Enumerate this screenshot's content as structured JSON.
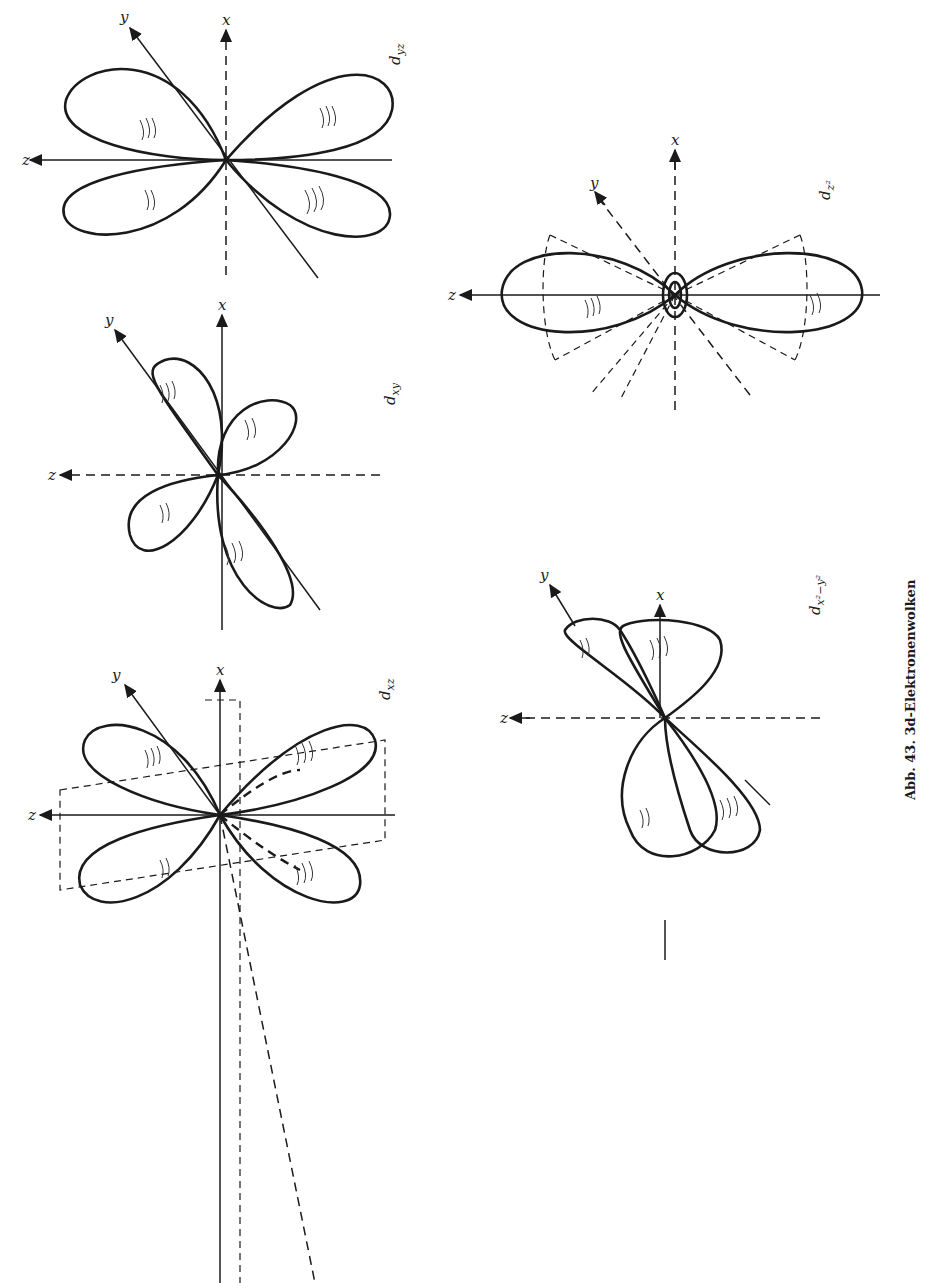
{
  "figure": {
    "caption": "Abb. 43. 3d-Elektronenwolken",
    "orientation": "rotated 90° counter-clockwise",
    "panels": [
      {
        "id": "dxz",
        "label": "d",
        "subscript": "xz",
        "axes": [
          "x",
          "y",
          "z"
        ]
      },
      {
        "id": "dxy",
        "label": "d",
        "subscript": "xy",
        "axes": [
          "x",
          "y",
          "z"
        ]
      },
      {
        "id": "dyz",
        "label": "d",
        "subscript": "yz",
        "axes": [
          "x",
          "y",
          "z"
        ]
      },
      {
        "id": "dx2y2",
        "label": "d",
        "subscript": "x²−y²",
        "axes": [
          "x",
          "y",
          "z"
        ]
      },
      {
        "id": "dz2",
        "label": "d",
        "subscript": "z²",
        "axes": [
          "x",
          "y",
          "z"
        ]
      }
    ]
  }
}
